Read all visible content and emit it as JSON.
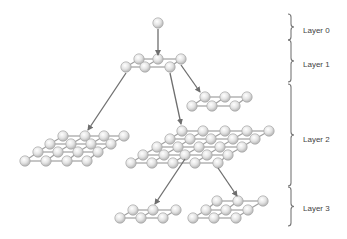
{
  "diagram": {
    "colors": {
      "atom_fill": "#e2e2e2",
      "atom_stroke": "#a8a8a8",
      "bond": "#a0a0a0",
      "arrow": "#6e6e6e",
      "brace": "#777777",
      "text": "#444444"
    },
    "layers": [
      {
        "label": "Layer 0",
        "brace_top": 14,
        "brace_bottom": 40,
        "label_y": 31
      },
      {
        "label": "Layer 1",
        "brace_top": 40,
        "brace_bottom": 82,
        "label_y": 65
      },
      {
        "label": "Layer 2",
        "brace_top": 84,
        "brace_bottom": 186,
        "label_y": 140
      },
      {
        "label": "Layer 3",
        "brace_top": 187,
        "brace_bottom": 226,
        "label_y": 209
      }
    ],
    "clusters": [
      {
        "name": "layer0-root",
        "rows": [
          [
            [
              158,
              23
            ]
          ]
        ]
      },
      {
        "name": "layer1-cluster",
        "rows": [
          [
            [
              139,
              59
            ],
            [
              158,
              59
            ],
            [
              181,
              59
            ]
          ],
          [
            [
              126,
              67
            ],
            [
              145,
              67
            ],
            [
              170,
              67
            ]
          ]
        ]
      },
      {
        "name": "layer2-small-cluster",
        "rows": [
          [
            [
              205,
              97
            ],
            [
              225,
              97
            ],
            [
              247,
              97
            ]
          ],
          [
            [
              192,
              106
            ],
            [
              212,
              106
            ],
            [
              235,
              106
            ]
          ]
        ]
      },
      {
        "name": "layer2-left-lattice",
        "rows": [
          [
            [
              63,
              136
            ],
            [
              85,
              136
            ],
            [
              104,
              136
            ],
            [
              124,
              136
            ]
          ],
          [
            [
              50,
              144
            ],
            [
              71,
              144
            ],
            [
              91,
              144
            ],
            [
              111,
              144
            ]
          ],
          [
            [
              38,
              152
            ],
            [
              58,
              152
            ],
            [
              78,
              152
            ],
            [
              98,
              152
            ]
          ],
          [
            [
              25,
              161
            ],
            [
              46,
              161
            ],
            [
              67,
              161
            ],
            [
              87,
              161
            ]
          ]
        ]
      },
      {
        "name": "layer2-big-lattice",
        "rows": [
          [
            [
              182,
              131
            ],
            [
              203,
              131
            ],
            [
              225,
              131
            ],
            [
              247,
              131
            ],
            [
              269,
              131
            ]
          ],
          [
            [
              170,
              139
            ],
            [
              190,
              139
            ],
            [
              211,
              139
            ],
            [
              233,
              139
            ],
            [
              255,
              139
            ]
          ],
          [
            [
              157,
              147
            ],
            [
              178,
              147
            ],
            [
              199,
              147
            ],
            [
              220,
              147
            ],
            [
              242,
              147
            ]
          ],
          [
            [
              143,
              155
            ],
            [
              164,
              155
            ],
            [
              185,
              155
            ],
            [
              207,
              155
            ],
            [
              228,
              155
            ]
          ],
          [
            [
              131,
              163
            ],
            [
              152,
              163
            ],
            [
              173,
              163
            ],
            [
              195,
              163
            ],
            [
              218,
              163
            ]
          ]
        ]
      },
      {
        "name": "layer3-left-cluster",
        "rows": [
          [
            [
              133,
              210
            ],
            [
              153,
              210
            ],
            [
              176,
              210
            ]
          ],
          [
            [
              120,
              218
            ],
            [
              141,
              218
            ],
            [
              163,
              218
            ]
          ]
        ]
      },
      {
        "name": "layer3-right-cluster",
        "rows": [
          [
            [
              217,
              201
            ],
            [
              238,
              201
            ],
            [
              263,
              201
            ]
          ],
          [
            [
              206,
              210
            ],
            [
              226,
              210
            ],
            [
              248,
              210
            ]
          ],
          [
            [
              193,
              218
            ],
            [
              214,
              218
            ],
            [
              236,
              218
            ]
          ]
        ]
      }
    ],
    "arrows": [
      {
        "from": [
          158,
          29
        ],
        "to": [
          158,
          55
        ]
      },
      {
        "from": [
          126,
          73
        ],
        "to": [
          88,
          130
        ]
      },
      {
        "from": [
          170,
          73
        ],
        "to": [
          181,
          124
        ]
      },
      {
        "from": [
          181,
          65
        ],
        "to": [
          200,
          92
        ]
      },
      {
        "from": [
          185,
          159
        ],
        "to": [
          155,
          204
        ]
      },
      {
        "from": [
          218,
          168
        ],
        "to": [
          237,
          196
        ]
      }
    ]
  }
}
